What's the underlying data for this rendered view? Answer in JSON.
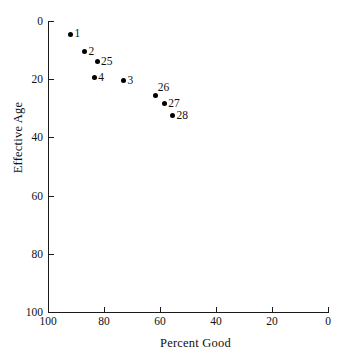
{
  "chart_data": {
    "type": "scatter",
    "title": "",
    "xlabel": "Percent Good",
    "ylabel": "Effective Age",
    "xlim": [
      100,
      0
    ],
    "ylim": [
      0,
      100
    ],
    "x_inverted": true,
    "y_inverted": true,
    "grid": false,
    "legend": false,
    "xticks": [
      100,
      80,
      60,
      40,
      20,
      0
    ],
    "xticklabels": [
      "100",
      "80",
      "60",
      "40",
      "20",
      "0"
    ],
    "yticks": [
      0,
      20,
      40,
      60,
      80,
      100
    ],
    "yticklabels": [
      "0",
      "20",
      "40",
      "60",
      "80",
      "100"
    ],
    "point_labels": [
      "1",
      "2",
      "25",
      "4",
      "3",
      "26",
      "27",
      "28"
    ],
    "x": [
      92,
      87,
      82.5,
      83.5,
      73,
      61.5,
      58.5,
      55.5
    ],
    "y": [
      4.5,
      10.5,
      14,
      19.5,
      20.5,
      25.5,
      28.5,
      32.5
    ],
    "points": [
      {
        "label": "1",
        "x": 92,
        "y": 4.5,
        "label_pos": "right"
      },
      {
        "label": "2",
        "x": 87,
        "y": 10.5,
        "label_pos": "right"
      },
      {
        "label": "25",
        "x": 82.5,
        "y": 14,
        "label_pos": "right"
      },
      {
        "label": "4",
        "x": 83.5,
        "y": 19.5,
        "label_pos": "right"
      },
      {
        "label": "3",
        "x": 73,
        "y": 20.5,
        "label_pos": "right"
      },
      {
        "label": "26",
        "x": 61.5,
        "y": 25.5,
        "label_pos": "above-right"
      },
      {
        "label": "27",
        "x": 58.5,
        "y": 28.5,
        "label_pos": "right"
      },
      {
        "label": "28",
        "x": 55.5,
        "y": 32.5,
        "label_pos": "right"
      }
    ],
    "marker": {
      "shape": "circle",
      "color": "#000000",
      "size": 5
    },
    "axis_color": "#1a1a1a",
    "background": "#ffffff"
  }
}
